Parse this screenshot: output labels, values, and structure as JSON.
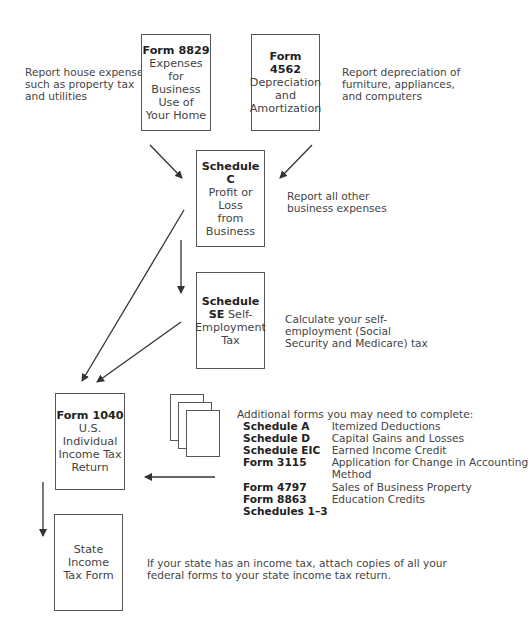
{
  "boxes": {
    "form8829": {
      "title": "Form 8829",
      "lines": [
        "Expenses",
        "for Business",
        "Use of",
        "Your Home"
      ]
    },
    "form4562": {
      "title": "Form 4562",
      "lines": [
        "Depreciation",
        "and",
        "Amortization"
      ]
    },
    "scheduleC": {
      "title": "Schedule C",
      "lines": [
        "Profit or Loss",
        "from Business"
      ]
    },
    "scheduleSE": {
      "title": "Schedule",
      "title2": "SE",
      "title2_rest": " Self-",
      "lines": [
        "Employment",
        "Tax"
      ]
    },
    "form1040": {
      "title": "Form 1040",
      "lines": [
        "U.S.",
        "Individual",
        "Income Tax",
        "Return"
      ]
    },
    "state": {
      "lines": [
        "State",
        "Income",
        "Tax Form"
      ]
    }
  },
  "notes": {
    "house": [
      "Report house expenses",
      "such as property tax",
      "and utilities"
    ],
    "depreciation": [
      "Report depreciation of",
      "furniture, appliances,",
      "and computers"
    ],
    "other_expenses": [
      "Report all other",
      "business expenses"
    ],
    "self_employment": [
      "Calculate your self-",
      "employment (Social",
      "Security and Medicare) tax"
    ],
    "state": [
      "If your state has an income tax, attach copies of all your",
      "federal forms to your state income tax return."
    ]
  },
  "additional_forms": {
    "heading": "Additional forms you may need to complete:",
    "items": [
      {
        "form": "Schedule A",
        "desc": "Itemized Deductions"
      },
      {
        "form": "Schedule D",
        "desc": "Capital Gains and Losses"
      },
      {
        "form": "Schedule EIC",
        "desc": "Earned Income Credit"
      },
      {
        "form": "Form 3115",
        "desc": "Application for Change in Accounting Method"
      },
      {
        "form": "Form 4797",
        "desc": "Sales of Business Property"
      },
      {
        "form": "Form 8863",
        "desc": "Education Credits"
      },
      {
        "form": "Schedules 1–3",
        "desc": ""
      }
    ]
  },
  "colors": {
    "line": "#333333",
    "border": "#555555",
    "text": "#444444"
  }
}
